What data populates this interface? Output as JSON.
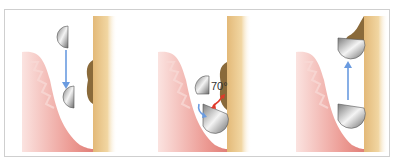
{
  "figure": {
    "panels": [
      {
        "id": "panel-1",
        "step": "insertion",
        "arrow_direction": "down",
        "arrow_color": "#6a9be0"
      },
      {
        "id": "panel-2",
        "step": "angulation",
        "angle_label": "70°",
        "angle_arrow_color": "#e03a2a",
        "rotate_arrow_color": "#6a9be0"
      },
      {
        "id": "panel-3",
        "step": "working-stroke",
        "arrow_direction": "up",
        "arrow_color": "#6a9be0"
      }
    ],
    "colors": {
      "gingiva": "#e88a84",
      "gingiva_light": "#f7cfcb",
      "tooth": "#e9c98a",
      "calculus": "#8a6a3a",
      "blade_light": "#f2f2f2",
      "blade_dark": "#8a8a8a",
      "frame_border": "#cfcfcf"
    }
  }
}
